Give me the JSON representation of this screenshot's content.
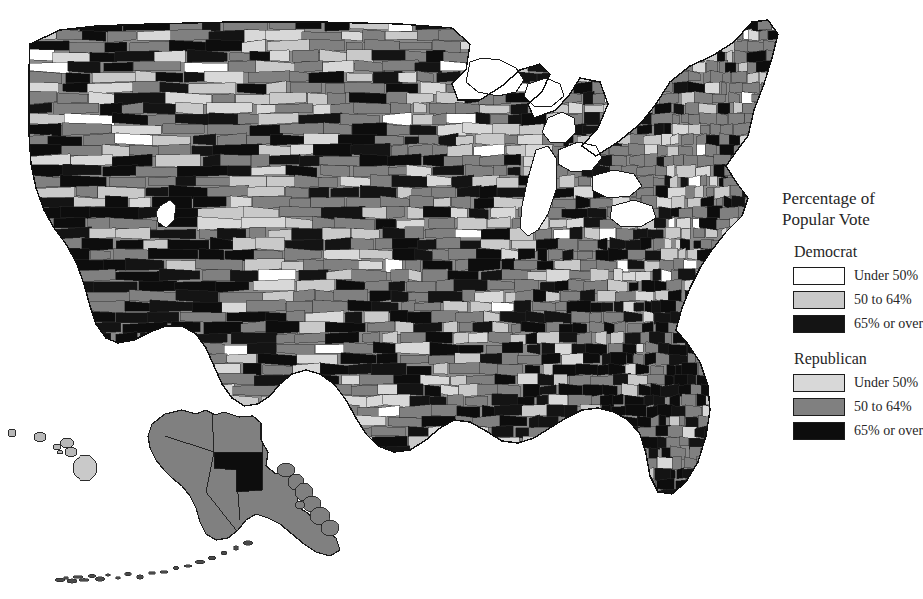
{
  "title": "1988",
  "legend": {
    "heading_line1": "Percentage of",
    "heading_line2": "Popular Vote",
    "groups": [
      {
        "name": "Democrat",
        "rows": [
          {
            "label": "Under 50%",
            "color": "#ffffff",
            "swatch_class": "sw-white"
          },
          {
            "label": "50 to 64%",
            "color": "#c9c9c9",
            "swatch_class": "sw-lightgray"
          },
          {
            "label": "65% or over",
            "color": "#141414",
            "swatch_class": "sw-black"
          }
        ]
      },
      {
        "name": "Republican",
        "rows": [
          {
            "label": "Under 50%",
            "color": "#d8d8d8",
            "swatch_class": "sw-verylight"
          },
          {
            "label": "50 to 64%",
            "color": "#808080",
            "swatch_class": "sw-midgray"
          },
          {
            "label": "65% or over",
            "color": "#0d0d0d",
            "swatch_class": "sw-black2"
          }
        ]
      }
    ]
  },
  "chart_data": {
    "type": "map",
    "map_type": "choropleth",
    "title": "1988",
    "geography": "United States counties, including Alaska and Hawaii insets",
    "projection_note": "Composite conterminous US with Alaska and Hawaii insets at lower left",
    "legend_title": "Percentage of Popular Vote",
    "classes": [
      {
        "party": "Democrat",
        "range": "Under 50%",
        "color": "#ffffff"
      },
      {
        "party": "Democrat",
        "range": "50 to 64%",
        "color": "#c9c9c9"
      },
      {
        "party": "Democrat",
        "range": "65% or over",
        "color": "#141414"
      },
      {
        "party": "Republican",
        "range": "Under 50%",
        "color": "#d8d8d8"
      },
      {
        "party": "Republican",
        "range": "50 to 64%",
        "color": "#808080"
      },
      {
        "party": "Republican",
        "range": "65% or over",
        "color": "#0d0d0d"
      }
    ],
    "regions": [
      {
        "name": "Pacific Northwest",
        "dominant_class": "Republican 50 to 64%"
      },
      {
        "name": "California",
        "dominant_class": "Republican 50 to 64%"
      },
      {
        "name": "Intermountain West",
        "dominant_class": "Republican 65% or over"
      },
      {
        "name": "Great Plains",
        "dominant_class": "Republican 50 to 64%"
      },
      {
        "name": "Upper Midwest",
        "dominant_class": "Democrat 50 to 64%"
      },
      {
        "name": "Deep South",
        "dominant_class": "Mixed, many Democrat 65% or over"
      },
      {
        "name": "Texas",
        "dominant_class": "Mixed Republican and Democrat"
      },
      {
        "name": "Northeast",
        "dominant_class": "Republican 50 to 64%"
      },
      {
        "name": "Florida",
        "dominant_class": "Republican 65% or over"
      },
      {
        "name": "Alaska",
        "dominant_class": "Republican 50 to 64%"
      },
      {
        "name": "Hawaii",
        "dominant_class": "Democrat 50 to 64%"
      }
    ],
    "grid": false,
    "legend_position": "right"
  }
}
